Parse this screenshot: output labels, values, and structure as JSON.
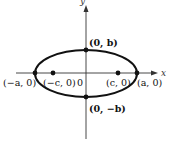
{
  "diagram": {
    "type": "ellipse-with-foci",
    "axes": {
      "x_label": "x",
      "y_label": "y",
      "origin_label": "0"
    },
    "points": {
      "top_vertex": {
        "label": "(0, b)",
        "x": 86,
        "y": 50
      },
      "bottom_vertex": {
        "label": "(0, −b)",
        "x": 86,
        "y": 97
      },
      "left_vertex": {
        "label": "(−a, 0)",
        "x": 35,
        "y": 73
      },
      "right_vertex": {
        "label": "(a, 0)",
        "x": 137,
        "y": 73
      },
      "left_focus": {
        "label": "(−c, 0)",
        "x": 53,
        "y": 73
      },
      "right_focus": {
        "label": "(c, 0)",
        "x": 118,
        "y": 73
      }
    },
    "ellipse": {
      "cx": 86,
      "cy": 73.5,
      "rx": 51,
      "ry": 23.5
    },
    "colors": {
      "stroke": "#111111",
      "axis": "#333333",
      "background": "#ffffff"
    }
  }
}
